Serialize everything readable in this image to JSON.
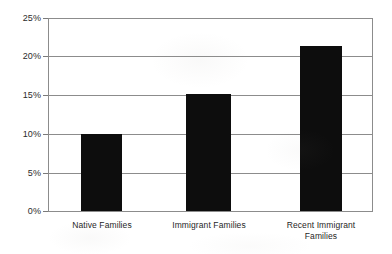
{
  "chart_data": {
    "type": "bar",
    "title": "",
    "subtitle": "",
    "xlabel": "",
    "ylabel": "",
    "categories": [
      "Native Families",
      "Immigrant Families",
      "Recent Immigrant Families"
    ],
    "values": [
      10.0,
      15.1,
      21.4
    ],
    "value_labels": [
      "10%",
      "15.1%",
      "21.4%"
    ],
    "ylim": [
      0,
      25
    ],
    "y_ticks": [
      0,
      5,
      10,
      15,
      20,
      25
    ],
    "y_tick_labels": [
      "0%",
      "5%",
      "10%",
      "15%",
      "20%",
      "25%"
    ],
    "grid": true,
    "grid_axis": "y",
    "legend": null,
    "legend_position": "none",
    "bar_color": "#0d0d0d",
    "grid_color": "#8c8c8c",
    "frame_color": "#8c8c8c",
    "background_color": "#ffffff",
    "annotations": []
  },
  "axes": {
    "y_ticks": [
      {
        "label": "25%",
        "value": 25
      },
      {
        "label": "20%",
        "value": 20
      },
      {
        "label": "15%",
        "value": 15
      },
      {
        "label": "10%",
        "value": 10
      },
      {
        "label": "5%",
        "value": 5
      },
      {
        "label": "0%",
        "value": 0
      }
    ]
  },
  "category_labels": [
    {
      "line1": "Native Families",
      "line2": ""
    },
    {
      "line1": "Immigrant Families",
      "line2": ""
    },
    {
      "line1": "Recent Immigrant",
      "line2": "Families"
    }
  ]
}
